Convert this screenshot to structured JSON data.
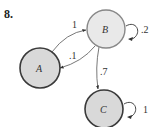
{
  "problem_number": "8.",
  "colors": {
    "node_stroke": "#3a3a3a",
    "node_fill_B": "#e9e9e9",
    "node_fill_A": "#d9d9d9",
    "node_fill_C": "#d9d9d9",
    "edge": "#555555"
  },
  "nodes": [
    {
      "id": "A",
      "label": "A",
      "cx": 40,
      "cy": 68,
      "r": 20
    },
    {
      "id": "B",
      "label": "B",
      "cx": 106,
      "cy": 29,
      "r": 19
    },
    {
      "id": "C",
      "label": "C",
      "cx": 104,
      "cy": 108,
      "r": 19
    }
  ],
  "edges": [
    {
      "from": "A",
      "to": "B",
      "label": "1"
    },
    {
      "from": "B",
      "to": "A",
      "label": ".1"
    },
    {
      "from": "B",
      "to": "C",
      "label": ".7"
    },
    {
      "from": "B",
      "to": "B",
      "label": ".2"
    },
    {
      "from": "C",
      "to": "C",
      "label": "1"
    }
  ]
}
